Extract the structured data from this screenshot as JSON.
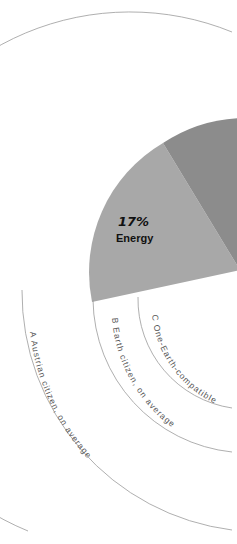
{
  "diagram": {
    "slices": [
      {
        "label": "Energy",
        "value": "17%",
        "color": "#a8a8a8"
      },
      {
        "label": "",
        "value": "",
        "color": "#8c8c8c"
      }
    ],
    "rings": [
      {
        "letter": "A",
        "label": "A  Austrian citizen, on average"
      },
      {
        "letter": "B",
        "label": "B  Earth citizen, on average"
      },
      {
        "letter": "C",
        "label": "C  One-Earth-compatible"
      }
    ],
    "colors": {
      "arc": "#9a9a9a",
      "slice_light": "#a8a8a8",
      "slice_dark": "#8c8c8c",
      "text": "#111111"
    }
  }
}
